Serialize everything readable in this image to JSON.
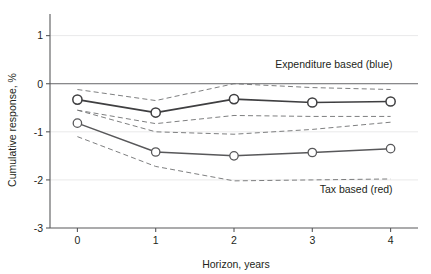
{
  "chart_data": {
    "type": "line",
    "title": "",
    "xlabel": "Horizon, years",
    "ylabel": "Cumulative response, %",
    "x": [
      0,
      1,
      2,
      3,
      4
    ],
    "xticklabels": [
      "0",
      "1",
      "2",
      "3",
      "4"
    ],
    "yticks": [
      1,
      0,
      -1,
      -2,
      -3
    ],
    "yticklabels": [
      "1",
      "0",
      "-1",
      "-2",
      "-3"
    ],
    "xlim": [
      -0.35,
      4.35
    ],
    "ylim": [
      -3,
      1.45
    ],
    "grid": true,
    "legend_position": "inline-annotation",
    "zero_line": 0,
    "series": [
      {
        "name": "Expenditure based (blue)",
        "values": [
          -0.33,
          -0.6,
          -0.32,
          -0.39,
          -0.37
        ],
        "ci_upper": [
          -0.12,
          -0.35,
          0.0,
          -0.08,
          -0.12
        ],
        "ci_lower": [
          -0.55,
          -0.83,
          -0.66,
          -0.68,
          -0.68
        ],
        "marker": "open-circle"
      },
      {
        "name": "Tax based (red)",
        "values": [
          -0.82,
          -1.42,
          -1.5,
          -1.43,
          -1.35
        ],
        "ci_upper": [
          -0.55,
          -1.0,
          -1.05,
          -0.95,
          -0.8
        ],
        "ci_lower": [
          -1.1,
          -1.72,
          -2.02,
          -2.0,
          -1.98
        ],
        "marker": "open-circle"
      }
    ],
    "annotations": [
      {
        "text": "Expenditure based (blue)",
        "x": 4,
        "y": 0.32,
        "align": "right"
      },
      {
        "text": "Tax based (red)",
        "x": 4,
        "y": -2.28,
        "align": "right"
      }
    ]
  }
}
